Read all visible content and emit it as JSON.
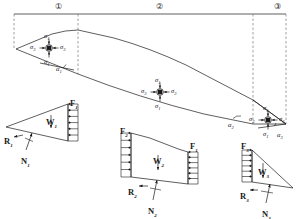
{
  "figure": {
    "stroke_color": "#1a1a1a",
    "dashed_color": "#7a7a7a",
    "background": "#ffffff"
  },
  "segment_labels": [
    {
      "name": "segment-1",
      "text": "①",
      "x": 55,
      "y": 3
    },
    {
      "name": "segment-2",
      "text": "②",
      "x": 156,
      "y": 3
    },
    {
      "name": "segment-3",
      "text": "③",
      "x": 274,
      "y": 3
    }
  ],
  "stress_elements": [
    {
      "name": "stress-element-1",
      "cx": 49,
      "cy": 48,
      "labels": [
        {
          "key": "top",
          "base": "σ",
          "sub": "1",
          "x": 44,
          "y": 33
        },
        {
          "key": "left",
          "base": "σ",
          "sub": "3",
          "x": 30,
          "y": 44
        },
        {
          "key": "right",
          "base": "σ",
          "sub": "3",
          "x": 60,
          "y": 44
        },
        {
          "key": "bottom",
          "base": "σ",
          "sub": "1",
          "x": 44,
          "y": 59
        }
      ]
    },
    {
      "name": "stress-element-2",
      "cx": 160,
      "cy": 92,
      "labels": [
        {
          "key": "top",
          "base": "σ",
          "sub": "1",
          "x": 155,
          "y": 77
        },
        {
          "key": "left",
          "base": "σ",
          "sub": "3",
          "x": 141,
          "y": 88
        },
        {
          "key": "right",
          "base": "σ",
          "sub": "3",
          "x": 171,
          "y": 88
        },
        {
          "key": "bottom",
          "base": "σ",
          "sub": "1",
          "x": 155,
          "y": 103
        }
      ]
    },
    {
      "name": "stress-element-3",
      "cx": 268,
      "cy": 120,
      "labels": [
        {
          "key": "top",
          "base": "σ",
          "sub": "1",
          "x": 263,
          "y": 105
        },
        {
          "key": "left",
          "base": "σ",
          "sub": "3",
          "x": 249,
          "y": 116
        },
        {
          "key": "right",
          "base": "σ",
          "sub": "3",
          "x": 279,
          "y": 116
        },
        {
          "key": "bottom",
          "base": "σ",
          "sub": "1",
          "x": 263,
          "y": 131
        }
      ]
    }
  ],
  "angle_labels": [
    {
      "name": "alpha-1",
      "base": "α",
      "sub": "1",
      "x": 56,
      "y": 66
    },
    {
      "name": "alpha-2",
      "base": "α",
      "sub": "2",
      "x": 228,
      "y": 122
    },
    {
      "name": "alpha-3",
      "base": "α",
      "sub": "3",
      "x": 277,
      "y": 132
    }
  ],
  "free_bodies": [
    {
      "name": "free-body-1",
      "forces": [
        {
          "name": "force-F1",
          "base": "F",
          "sub": "1",
          "x": 70,
          "y": 99
        },
        {
          "name": "weight-W1",
          "base": "W",
          "sub": "1",
          "x": 46,
          "y": 118
        },
        {
          "name": "react-R1",
          "base": "R",
          "sub": "1",
          "x": 4,
          "y": 137
        },
        {
          "name": "normal-N1",
          "base": "N",
          "sub": "1",
          "x": 21,
          "y": 157
        }
      ]
    },
    {
      "name": "free-body-2",
      "forces": [
        {
          "name": "force-F2",
          "base": "F",
          "sub": "2",
          "x": 120,
          "y": 127
        },
        {
          "name": "force-F1-right",
          "base": "F",
          "sub": "1",
          "x": 190,
          "y": 142
        },
        {
          "name": "weight-W2",
          "base": "W",
          "sub": "2",
          "x": 153,
          "y": 157
        },
        {
          "name": "react-R2",
          "base": "R",
          "sub": "2",
          "x": 128,
          "y": 188
        },
        {
          "name": "normal-N2",
          "base": "N",
          "sub": "2",
          "x": 148,
          "y": 207
        }
      ]
    },
    {
      "name": "free-body-3",
      "forces": [
        {
          "name": "force-F3",
          "base": "F",
          "sub": "3",
          "x": 241,
          "y": 142
        },
        {
          "name": "weight-W3",
          "base": "W",
          "sub": "3",
          "x": 258,
          "y": 168
        },
        {
          "name": "react-R3",
          "base": "R",
          "sub": "3",
          "x": 240,
          "y": 192
        },
        {
          "name": "normal-N3",
          "base": "N",
          "sub": "3",
          "x": 262,
          "y": 210
        }
      ]
    }
  ]
}
